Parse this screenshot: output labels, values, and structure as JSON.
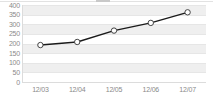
{
  "chart_data": {
    "type": "line",
    "title": "",
    "subtitle": "",
    "xlabel": "",
    "ylabel": "",
    "categories": [
      "12/03",
      "12/04",
      "12/05",
      "12/06",
      "12/07"
    ],
    "series": [
      {
        "name": "series-1",
        "values": [
          192,
          208,
          267,
          307,
          362
        ],
        "line_color": "#1a1a1a",
        "marker": "open-circle",
        "marker_fill": "#ffffff",
        "marker_edge": "#444444"
      }
    ],
    "ylim": [
      0,
      400
    ],
    "yticks": [
      400,
      350,
      300,
      250,
      200,
      150,
      100,
      50,
      0
    ],
    "ytick_labels": [
      "400",
      "350",
      "300",
      "250",
      "200",
      "150",
      "100",
      "50",
      "0"
    ],
    "xtick_labels": [
      "12/03",
      "12/04",
      "12/05",
      "12/06",
      "12/07"
    ],
    "grid": true,
    "grid_style": "alternating-horizontal-bands",
    "legend": false,
    "legend_position": "none",
    "band_color": "#efefef",
    "background_color": "#ffffff",
    "axis_label_color": "#8a8a8a",
    "gridline_color": "#e6e6e6"
  }
}
